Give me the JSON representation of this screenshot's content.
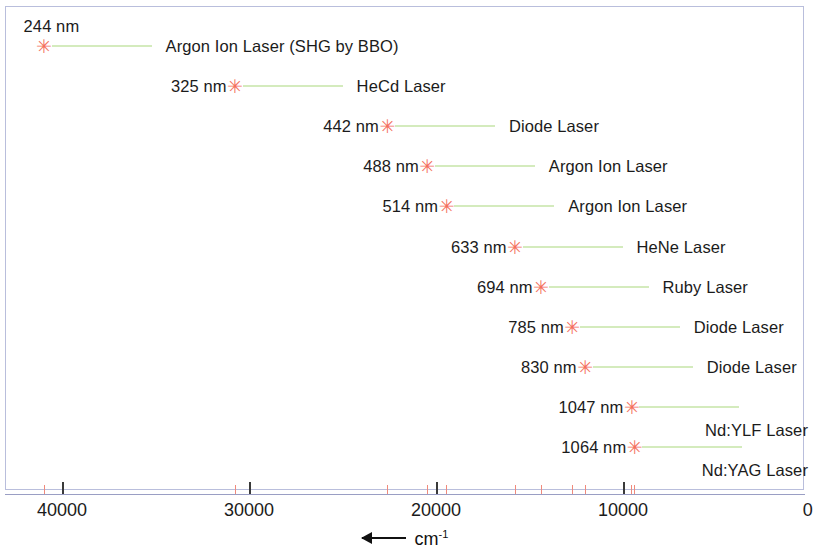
{
  "chart_data": {
    "type": "scatter",
    "title": "",
    "xlabel": "cm-1",
    "xlabel_display": "cm",
    "xlabel_sup": "-1",
    "ylabel": "",
    "xlim": [
      42000,
      0
    ],
    "x_reversed": true,
    "grid": false,
    "legend": "none",
    "xticks": [
      40000,
      30000,
      20000,
      10000,
      0
    ],
    "xticklabels": [
      "40000",
      "30000",
      "20000",
      "10000",
      "0"
    ],
    "marker_color": "#f4705e",
    "leader_color": "#a9d87d",
    "axis_color": "#9a9ec4",
    "frame_color": "#b9bedc",
    "text_color": "#1b1b1b",
    "points": [
      {
        "wavelength_label": "244 nm",
        "wavenumber": 40984,
        "name": "Argon Ion Laser (SHG by BBO)",
        "label_above": true,
        "name_below": false
      },
      {
        "wavelength_label": "325 nm",
        "wavenumber": 30769,
        "name": "HeCd Laser",
        "label_above": false,
        "name_below": false
      },
      {
        "wavelength_label": "442 nm",
        "wavenumber": 22624,
        "name": "Diode Laser",
        "label_above": false,
        "name_below": false
      },
      {
        "wavelength_label": "488 nm",
        "wavenumber": 20492,
        "name": "Argon Ion Laser",
        "label_above": false,
        "name_below": false
      },
      {
        "wavelength_label": "514 nm",
        "wavenumber": 19455,
        "name": "Argon Ion Laser",
        "label_above": false,
        "name_below": false
      },
      {
        "wavelength_label": "633 nm",
        "wavenumber": 15798,
        "name": "HeNe Laser",
        "label_above": false,
        "name_below": false
      },
      {
        "wavelength_label": "694 nm",
        "wavenumber": 14409,
        "name": "Ruby Laser",
        "label_above": false,
        "name_below": false
      },
      {
        "wavelength_label": "785 nm",
        "wavenumber": 12739,
        "name": "Diode Laser",
        "label_above": false,
        "name_below": false
      },
      {
        "wavelength_label": "830 nm",
        "wavenumber": 12048,
        "name": "Diode Laser",
        "label_above": false,
        "name_below": false
      },
      {
        "wavelength_label": "1047 nm",
        "wavenumber": 9551,
        "name": "Nd:YLF Laser",
        "label_above": false,
        "name_below": true
      },
      {
        "wavelength_label": "1064 nm",
        "wavenumber": 9398,
        "name": "Nd:YAG Laser",
        "label_above": false,
        "name_below": true
      }
    ]
  },
  "marker_glyph": "✳"
}
